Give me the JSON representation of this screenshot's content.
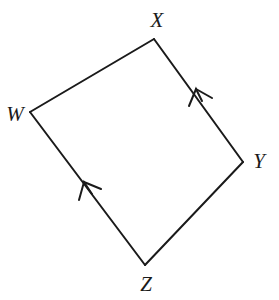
{
  "figure": {
    "name": "quadrilateral-wxyz",
    "kind": "geometry-diagram",
    "width": 279,
    "height": 300,
    "background_color": "#ffffff",
    "stroke_color": "#1a1a1a",
    "stroke_width": 2,
    "label_color": "#1a1a1a",
    "label_style": "italic-serif",
    "label_font_size": 21
  },
  "vertices": [
    {
      "id": "W",
      "label": "W",
      "x": 30,
      "y": 112,
      "label_x": 15,
      "label_y": 114
    },
    {
      "id": "X",
      "label": "X",
      "x": 154,
      "y": 39,
      "label_x": 157,
      "label_y": 20
    },
    {
      "id": "Y",
      "label": "Y",
      "x": 243,
      "y": 162,
      "label_x": 259,
      "label_y": 161
    },
    {
      "id": "Z",
      "label": "Z",
      "x": 145,
      "y": 265,
      "label_x": 146,
      "label_y": 284
    }
  ],
  "edges": [
    {
      "id": "WX",
      "from": "W",
      "to": "X",
      "x1": 30,
      "y1": 112,
      "x2": 154,
      "y2": 39,
      "marked": false
    },
    {
      "id": "XY",
      "from": "X",
      "to": "Y",
      "x1": 154,
      "y1": 39,
      "x2": 243,
      "y2": 162,
      "marked": true
    },
    {
      "id": "YZ",
      "from": "Y",
      "to": "Z",
      "x1": 243,
      "y1": 162,
      "x2": 145,
      "y2": 265,
      "marked": false
    },
    {
      "id": "ZW",
      "from": "Z",
      "to": "W",
      "x1": 145,
      "y1": 265,
      "x2": 30,
      "y2": 112,
      "marked": true
    }
  ],
  "arrow_marks": [
    {
      "id": "arrow-on-xy",
      "on_edge": "XY",
      "direction": "toward-X",
      "tip_x": 196,
      "tip_y": 89,
      "barb1_x": 189,
      "barb1_y": 105,
      "barb2_x": 211,
      "barb2_y": 97,
      "tail_x": 208,
      "tail_y": 106
    },
    {
      "id": "arrow-on-zw",
      "on_edge": "ZW",
      "direction": "toward-W",
      "tip_x": 84,
      "tip_y": 182,
      "barb1_x": 80,
      "barb1_y": 199,
      "barb2_x": 100,
      "barb2_y": 186,
      "tail_x": 96,
      "tail_y": 196
    }
  ],
  "vertex_w": {
    "label": "W"
  },
  "vertex_x": {
    "label": "X"
  },
  "vertex_y": {
    "label": "Y"
  },
  "vertex_z": {
    "label": "Z"
  }
}
